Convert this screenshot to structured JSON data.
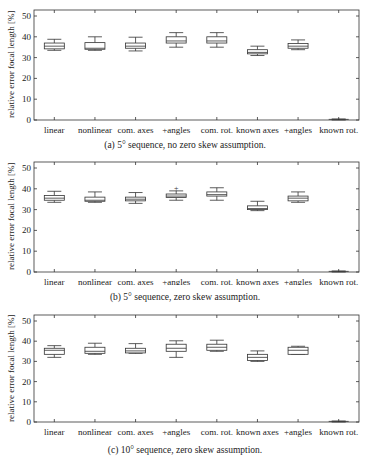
{
  "chart_data": [
    {
      "type": "box",
      "title": "(a) 5° sequence, no zero skew assumption.",
      "xlabel": "",
      "ylabel": "relative error focal length [%]",
      "ylim": [
        0,
        52
      ],
      "yticks": [
        0,
        10,
        20,
        30,
        40,
        50
      ],
      "grid": false,
      "categories": [
        "linear",
        "nonlinear",
        "com. axes",
        "+angles",
        "com. rot.",
        "known axes",
        "+angles",
        "known rot."
      ],
      "series": [
        {
          "name": "linear",
          "whisker_low": 33.5,
          "q1": 34.2,
          "median": 35.5,
          "q3": 37.0,
          "whisker_high": 38.8
        },
        {
          "name": "nonlinear",
          "whisker_low": 33.5,
          "q1": 34.0,
          "median": 34.5,
          "q3": 37.2,
          "whisker_high": 40.0
        },
        {
          "name": "com. axes",
          "whisker_low": 33.2,
          "q1": 34.5,
          "median": 35.5,
          "q3": 37.0,
          "whisker_high": 39.8
        },
        {
          "name": "+angles",
          "whisker_low": 35.0,
          "q1": 37.0,
          "median": 38.0,
          "q3": 40.0,
          "whisker_high": 42.0
        },
        {
          "name": "com. rot.",
          "whisker_low": 35.0,
          "q1": 37.0,
          "median": 38.0,
          "q3": 40.0,
          "whisker_high": 42.0
        },
        {
          "name": "known axes",
          "whisker_low": 31.0,
          "q1": 31.8,
          "median": 32.5,
          "q3": 33.8,
          "whisker_high": 35.5
        },
        {
          "name": "+angles",
          "whisker_low": 33.8,
          "q1": 34.5,
          "median": 35.5,
          "q3": 36.8,
          "whisker_high": 38.5
        },
        {
          "name": "known rot.",
          "whisker_low": 0.0,
          "q1": 0.2,
          "median": 0.3,
          "q3": 0.4,
          "whisker_high": 0.5
        }
      ]
    },
    {
      "type": "box",
      "title": "(b) 5° sequence, zero skew assumption.",
      "xlabel": "",
      "ylabel": "relative error focal length [%]",
      "ylim": [
        0,
        52
      ],
      "yticks": [
        0,
        10,
        20,
        30,
        40,
        50
      ],
      "grid": false,
      "categories": [
        "linear",
        "nonlinear",
        "com. axes",
        "+angles",
        "com. rot.",
        "known axes",
        "+angles",
        "known rot."
      ],
      "series": [
        {
          "name": "linear",
          "whisker_low": 33.5,
          "q1": 34.5,
          "median": 35.5,
          "q3": 36.8,
          "whisker_high": 38.8
        },
        {
          "name": "nonlinear",
          "whisker_low": 33.5,
          "q1": 34.0,
          "median": 34.5,
          "q3": 36.0,
          "whisker_high": 38.5
        },
        {
          "name": "com. axes",
          "whisker_low": 33.0,
          "q1": 34.2,
          "median": 35.0,
          "q3": 36.0,
          "whisker_high": 38.2
        },
        {
          "name": "+angles",
          "whisker_low": 34.5,
          "q1": 35.8,
          "median": 36.5,
          "q3": 37.5,
          "whisker_high": 39.0,
          "outliers": [
            40.5
          ]
        },
        {
          "name": "com. rot.",
          "whisker_low": 34.5,
          "q1": 36.5,
          "median": 37.2,
          "q3": 38.5,
          "whisker_high": 40.5
        },
        {
          "name": "known axes",
          "whisker_low": 29.5,
          "q1": 30.0,
          "median": 30.5,
          "q3": 31.8,
          "whisker_high": 34.0
        },
        {
          "name": "+angles",
          "whisker_low": 33.5,
          "q1": 34.2,
          "median": 35.5,
          "q3": 36.5,
          "whisker_high": 38.5
        },
        {
          "name": "known rot.",
          "whisker_low": 0.0,
          "q1": 0.2,
          "median": 0.3,
          "q3": 0.4,
          "whisker_high": 0.5
        }
      ]
    },
    {
      "type": "box",
      "title": "(c) 10° sequence, zero skew assumption.",
      "xlabel": "",
      "ylabel": "relative error focal length [%]",
      "ylim": [
        0,
        52
      ],
      "yticks": [
        0,
        10,
        20,
        30,
        40,
        50
      ],
      "grid": false,
      "categories": [
        "linear",
        "nonlinear",
        "com. axes",
        "+angles",
        "com. rot.",
        "known axes",
        "+angles",
        "known rot."
      ],
      "series": [
        {
          "name": "linear",
          "whisker_low": 32.0,
          "q1": 33.5,
          "median": 35.5,
          "q3": 36.5,
          "whisker_high": 37.8
        },
        {
          "name": "nonlinear",
          "whisker_low": 33.5,
          "q1": 34.0,
          "median": 35.0,
          "q3": 37.0,
          "whisker_high": 39.0
        },
        {
          "name": "com. axes",
          "whisker_low": 34.0,
          "q1": 34.2,
          "median": 35.2,
          "q3": 36.5,
          "whisker_high": 38.8
        },
        {
          "name": "+angles",
          "whisker_low": 32.0,
          "q1": 35.0,
          "median": 36.5,
          "q3": 38.5,
          "whisker_high": 40.2
        },
        {
          "name": "com. rot.",
          "whisker_low": 35.0,
          "q1": 35.5,
          "median": 37.0,
          "q3": 38.5,
          "whisker_high": 40.5
        },
        {
          "name": "known axes",
          "whisker_low": 30.0,
          "q1": 30.5,
          "median": 32.0,
          "q3": 33.5,
          "whisker_high": 35.2
        },
        {
          "name": "+angles",
          "whisker_low": 33.5,
          "q1": 33.5,
          "median": 35.5,
          "q3": 37.0,
          "whisker_high": 37.5
        },
        {
          "name": "known rot.",
          "whisker_low": 0.0,
          "q1": 0.2,
          "median": 0.3,
          "q3": 0.4,
          "whisker_high": 0.5
        }
      ]
    }
  ],
  "panels": [
    {
      "caption": "(a) 5° sequence, no zero skew assumption.",
      "ylabel": "relative error focal length [%]"
    },
    {
      "caption": "(b) 5° sequence, zero skew assumption.",
      "ylabel": "relative error focal length [%]"
    },
    {
      "caption": "(c) 10° sequence, zero skew assumption.",
      "ylabel": "relative error focal length [%]"
    }
  ],
  "style": {
    "line_color": "#333333",
    "background": "#ffffff"
  }
}
